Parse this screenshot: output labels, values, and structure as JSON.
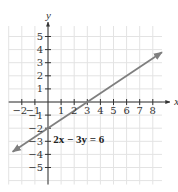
{
  "chart_data": {
    "type": "line",
    "title": "",
    "xlabel": "x",
    "ylabel": "y",
    "xlim": [
      -3,
      9
    ],
    "ylim": [
      -6,
      6
    ],
    "grid": true,
    "x_ticks": [
      -2,
      -1,
      1,
      2,
      3,
      4,
      5,
      6,
      7,
      8
    ],
    "y_ticks": [
      5,
      4,
      3,
      2,
      1,
      -1,
      -2,
      -3,
      -4,
      -5
    ],
    "x_tick_labels": [
      "-2",
      "-1",
      "1",
      "2",
      "3",
      "4",
      "5",
      "6",
      "7",
      "8"
    ],
    "y_tick_labels": [
      "5",
      "4",
      "3",
      "2",
      "1",
      "-1",
      "-2",
      "-3",
      "-4",
      "-5"
    ],
    "series": [
      {
        "name": "2x − 3y = 6",
        "equation": "2x − 3y = 6",
        "x": [
          -2.7,
          8.7
        ],
        "y": [
          -3.8,
          3.8
        ],
        "color": "#7f7f7f",
        "arrows": "both"
      }
    ],
    "annotations": [
      {
        "text": "2x − 3y = 6",
        "x": 0.4,
        "y": -3.1
      }
    ],
    "intercepts": {
      "x": 3,
      "y": -2
    }
  },
  "labels": {
    "x_axis": "x",
    "y_axis": "y",
    "equation": "2x − 3y = 6"
  },
  "colors": {
    "grid": "#e3e3e3",
    "axis": "#333333",
    "line": "#7f7f7f"
  }
}
